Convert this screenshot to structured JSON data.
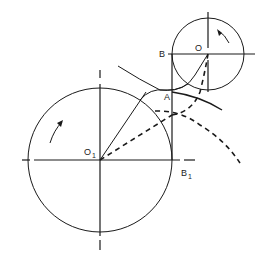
{
  "labels": {
    "B": "B",
    "O": "O",
    "A": "A",
    "O1_main": "O",
    "O1_sub": "1",
    "B1_main": "B",
    "B1_sub": "1"
  },
  "colors": {
    "stroke": "#1a1a1a",
    "background": "#ffffff"
  }
}
